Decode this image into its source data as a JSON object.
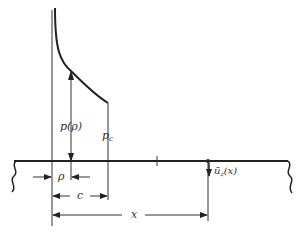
{
  "diagram": {
    "type": "contact-pressure-on-half-space",
    "colors": {
      "stroke": "#222222",
      "background": "#ffffff"
    },
    "labels": {
      "pressure": "p(ρ)",
      "pressure_edge": "p",
      "pressure_edge_sub": "c",
      "rho": "ρ",
      "c": "c",
      "x": "x",
      "displacement": "ū",
      "displacement_sub": "z",
      "displacement_arg": "(x)"
    },
    "elements": [
      "surface-line",
      "axis-line",
      "pressure-curve",
      "pressure-arrow",
      "edge-line",
      "tick-mark",
      "displacement-arrow",
      "dimension-rho",
      "dimension-c",
      "dimension-x",
      "break-left",
      "break-right"
    ]
  }
}
